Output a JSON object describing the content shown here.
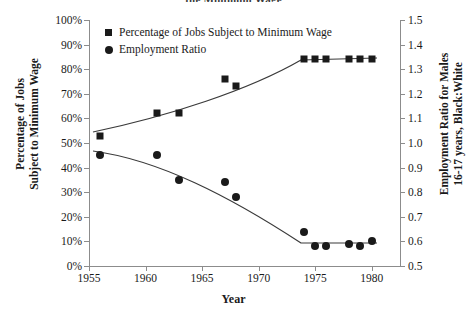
{
  "title_clipped": "the Minimum Wage",
  "axes": {
    "x": {
      "label": "Year",
      "ticks": [
        "1955",
        "1960",
        "1965",
        "1970",
        "1975",
        "1980"
      ],
      "tick_values": [
        1955,
        1960,
        1965,
        1970,
        1975,
        1980
      ],
      "min": 1955,
      "max": 1982.5
    },
    "y_left": {
      "label_line1": "Percentage of Jobs",
      "label_line2": "Subject to Minimum Wage",
      "ticks": [
        "0%",
        "10%",
        "20%",
        "30%",
        "40%",
        "50%",
        "60%",
        "70%",
        "80%",
        "90%",
        "100%"
      ],
      "tick_values": [
        0,
        10,
        20,
        30,
        40,
        50,
        60,
        70,
        80,
        90,
        100
      ],
      "min": 0,
      "max": 100
    },
    "y_right": {
      "label_line1": "Employment Ratio for Males",
      "label_line2": "16-17 years, Black:White",
      "ticks": [
        "0.5",
        "0.6",
        "0.7",
        "0.8",
        "0.9",
        "1.0",
        "1.1",
        "1.2",
        "1.3",
        "1.4",
        "1.5"
      ],
      "tick_values": [
        0.5,
        0.6,
        0.7,
        0.8,
        0.9,
        1.0,
        1.1,
        1.2,
        1.3,
        1.4,
        1.5
      ],
      "min": 0.5,
      "max": 1.5
    }
  },
  "legend": {
    "position": "top-left-inside",
    "items": [
      {
        "label": "Percentage of Jobs Subject to Minimum Wage",
        "marker": "square"
      },
      {
        "label": "Employment Ratio",
        "marker": "circle"
      }
    ]
  },
  "colors": {
    "marker": "#1a1a1a",
    "axis": "#8c8c8c",
    "trend": "#3a3a3a",
    "background": "#ffffff"
  },
  "chart_data": {
    "type": "scatter",
    "title": "the Minimum Wage",
    "xlabel": "Year",
    "ylabel": "Percentage of Jobs Subject to Minimum Wage",
    "y2label": "Employment Ratio for Males 16-17 years, Black:White",
    "xlim": [
      1955,
      1982.5
    ],
    "ylim": [
      0,
      100
    ],
    "y2lim": [
      0.5,
      1.5
    ],
    "grid": false,
    "legend_position": "upper left",
    "series": [
      {
        "name": "Percentage of Jobs Subject to Minimum Wage",
        "marker": "square",
        "axis": "left",
        "unit": "%",
        "points": [
          {
            "x": 1956.0,
            "y": 53
          },
          {
            "x": 1961.0,
            "y": 62
          },
          {
            "x": 1963.0,
            "y": 62
          },
          {
            "x": 1967.0,
            "y": 76
          },
          {
            "x": 1968.0,
            "y": 73
          },
          {
            "x": 1974.0,
            "y": 84
          },
          {
            "x": 1975.0,
            "y": 84
          },
          {
            "x": 1976.0,
            "y": 84
          },
          {
            "x": 1978.0,
            "y": 84
          },
          {
            "x": 1979.0,
            "y": 84
          },
          {
            "x": 1980.0,
            "y": 84
          }
        ]
      },
      {
        "name": "Employment Ratio",
        "marker": "circle",
        "axis": "right",
        "unit": "",
        "points": [
          {
            "x": 1956.0,
            "y": 0.95
          },
          {
            "x": 1961.0,
            "y": 0.95
          },
          {
            "x": 1963.0,
            "y": 0.85
          },
          {
            "x": 1967.0,
            "y": 0.84
          },
          {
            "x": 1968.0,
            "y": 0.78
          },
          {
            "x": 1974.0,
            "y": 0.64
          },
          {
            "x": 1975.0,
            "y": 0.58
          },
          {
            "x": 1976.0,
            "y": 0.58
          },
          {
            "x": 1978.0,
            "y": 0.59
          },
          {
            "x": 1979.0,
            "y": 0.58
          },
          {
            "x": 1980.0,
            "y": 0.6
          }
        ]
      }
    ],
    "trendlines": [
      {
        "name": "Percentage of Jobs trend",
        "series": "Percentage of Jobs Subject to Minimum Wage",
        "shape": "rising-then-flat"
      },
      {
        "name": "Employment Ratio trend",
        "series": "Employment Ratio",
        "shape": "falling-then-flat"
      }
    ]
  }
}
